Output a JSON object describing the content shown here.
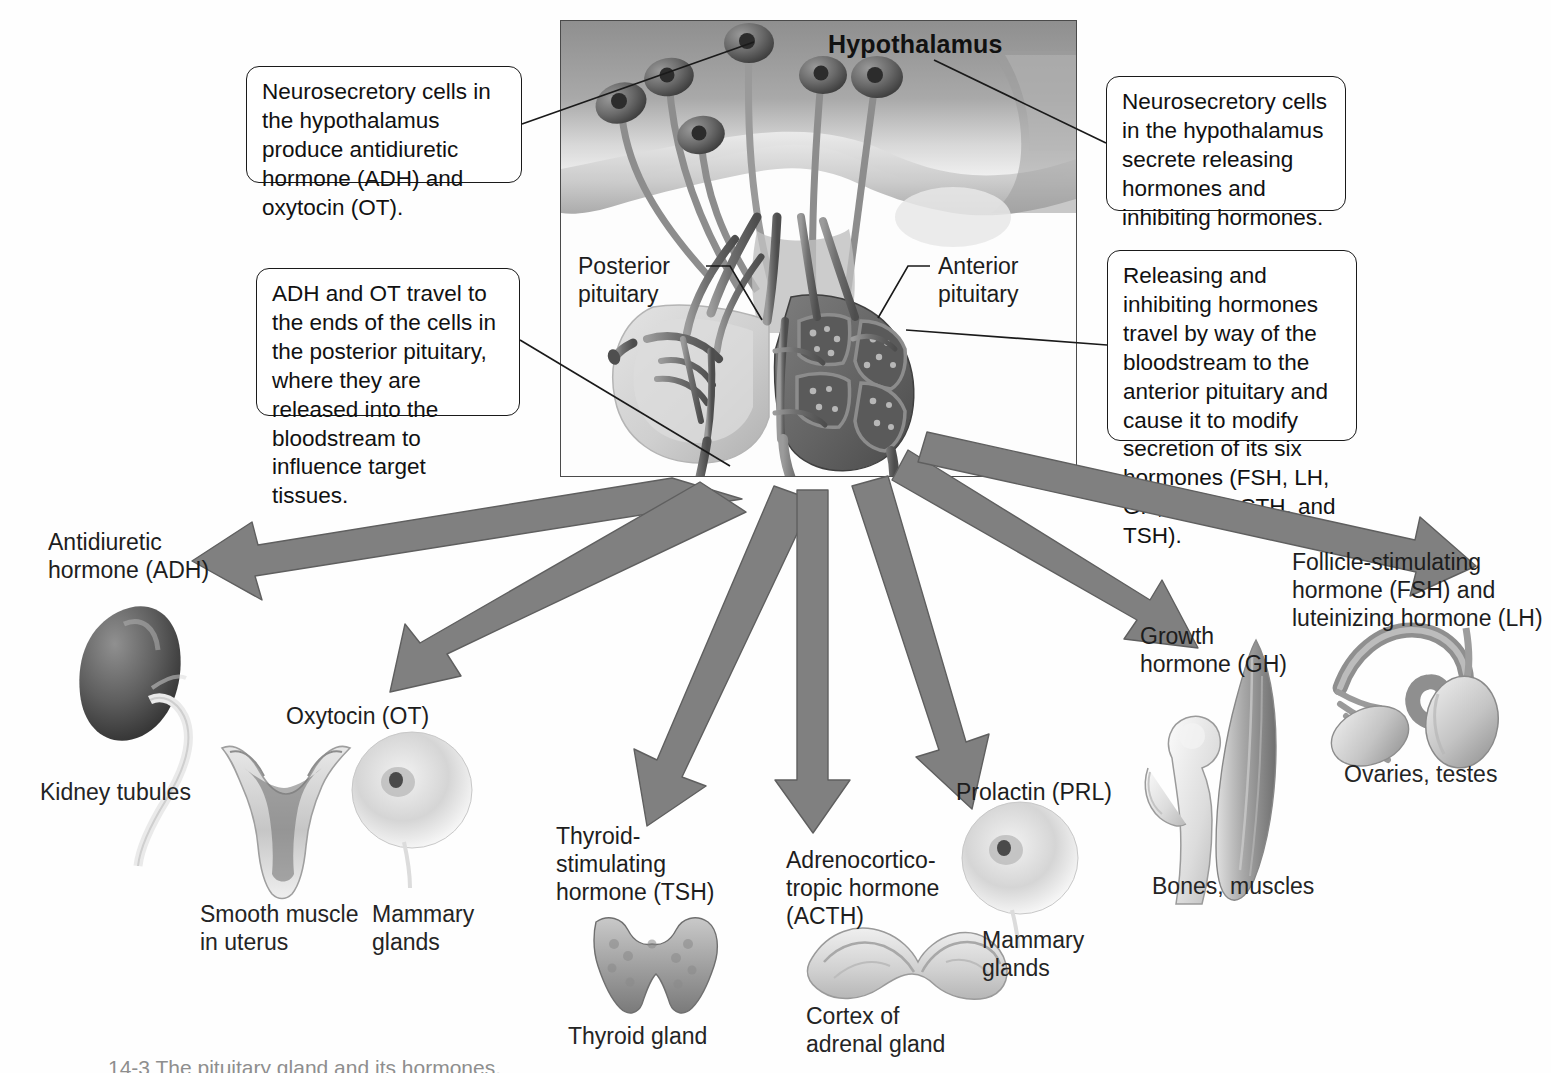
{
  "figure": {
    "panel_title": "Hypothalamus",
    "caption": "14-3  The pituitary gland and its hormones."
  },
  "panel_labels": [
    {
      "name": "posterior-pituitary",
      "text": "Posterior\npituitary"
    },
    {
      "name": "anterior-pituitary",
      "text": "Anterior\npituitary"
    }
  ],
  "callouts": [
    {
      "name": "adh-ot-production",
      "text": "Neurosecretory cells in the hypothalamus produce antidiuretic hormone (ADH) and oxytocin (OT)."
    },
    {
      "name": "releasing-hormones",
      "text": "Neurosecretory cells in the hypothalamus secrete releasing hormones and inhibiting hormones."
    },
    {
      "name": "adh-ot-transport",
      "text": "ADH and OT travel to the ends of the cells in the posterior pituitary, where they are released into the bloodstream to influence target tissues."
    },
    {
      "name": "anterior-pituitary-modulation",
      "text": "Releasing and inhibiting hormones travel by way of the bloodstream to the anterior pituitary and cause it to modify secretion of its six hormones (FSH, LH, GH, PRL, ACTH, and TSH)."
    }
  ],
  "hormones": [
    {
      "name": "adh",
      "label": "Antidiuretic\nhormone (ADH)",
      "target": "Kidney tubules",
      "organ": "kidney"
    },
    {
      "name": "ot",
      "label": "Oxytocin (OT)",
      "target": "Smooth muscle\nin uterus",
      "organ": "uterus"
    },
    {
      "name": "ot2",
      "label": "",
      "target": "Mammary\nglands",
      "organ": "breast"
    },
    {
      "name": "tsh",
      "label": "Thyroid-\nstimulating\nhormone (TSH)",
      "target": "Thyroid gland",
      "organ": "thyroid"
    },
    {
      "name": "acth",
      "label": "Adrenocortico-\ntropic hormone\n(ACTH)",
      "target": "Cortex of\nadrenal gland",
      "organ": "adrenal"
    },
    {
      "name": "prl",
      "label": "Prolactin (PRL)",
      "target": "Mammary\nglands",
      "organ": "breast"
    },
    {
      "name": "gh",
      "label": "Growth\nhormone (GH)",
      "target": "Bones, muscles",
      "organ": "bone-muscle"
    },
    {
      "name": "fsh-lh",
      "label": "Follicle-stimulating\nhormone (FSH) and\nluteinizing hormone (LH)",
      "target": "Ovaries, testes",
      "organ": "gonads"
    }
  ],
  "colors": {
    "arrow_fill": "#808080",
    "arrow_stroke": "#5f5f5f",
    "callout_border": "#1a1a1a",
    "text": "#1d1d1d",
    "frame_border": "#4a4a4a"
  }
}
